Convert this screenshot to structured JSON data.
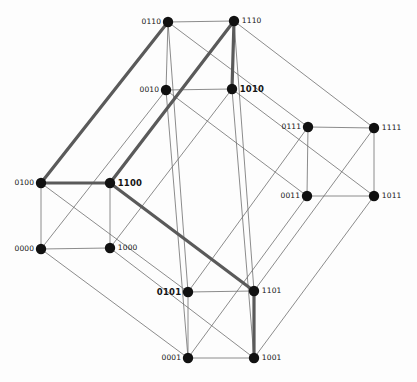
{
  "figure": {
    "kind": "hypercube-graph",
    "title": "",
    "width": 417,
    "height": 382,
    "background": "#fdfdfd",
    "colors": {
      "node_fill": "#111111",
      "edge_normal": "#6e6e6e",
      "edge_highlight": "#5a5a5a",
      "label": "#141414"
    },
    "node_radius": 5.2,
    "edge_width_normal": 0.8,
    "edge_width_highlight": 3.2
  },
  "nodes": [
    {
      "id": "0110",
      "label": "0110",
      "x": 168,
      "y": 22,
      "label_side": "left",
      "bold": false
    },
    {
      "id": "1110",
      "label": "1110",
      "x": 234,
      "y": 21,
      "label_side": "right",
      "bold": false
    },
    {
      "id": "0010",
      "label": "0010",
      "x": 166,
      "y": 90,
      "label_side": "left",
      "bold": false
    },
    {
      "id": "1010",
      "label": "1010",
      "x": 232,
      "y": 89,
      "label_side": "right",
      "bold": true
    },
    {
      "id": "0111",
      "label": "0111",
      "x": 308,
      "y": 127,
      "label_side": "left",
      "bold": false
    },
    {
      "id": "1111",
      "label": "1111",
      "x": 374,
      "y": 128,
      "label_side": "right",
      "bold": false
    },
    {
      "id": "0011",
      "label": "0011",
      "x": 307,
      "y": 196,
      "label_side": "left",
      "bold": false
    },
    {
      "id": "1011",
      "label": "1011",
      "x": 374,
      "y": 196,
      "label_side": "right",
      "bold": false
    },
    {
      "id": "0100",
      "label": "0100",
      "x": 41,
      "y": 183,
      "label_side": "left",
      "bold": false
    },
    {
      "id": "1100",
      "label": "1100",
      "x": 110,
      "y": 183,
      "label_side": "right",
      "bold": true
    },
    {
      "id": "0000",
      "label": "0000",
      "x": 41,
      "y": 249,
      "label_side": "left",
      "bold": false
    },
    {
      "id": "1000",
      "label": "1000",
      "x": 110,
      "y": 248,
      "label_side": "right",
      "bold": false
    },
    {
      "id": "0101",
      "label": "0101",
      "x": 188,
      "y": 292,
      "label_side": "left",
      "bold": true
    },
    {
      "id": "1101",
      "label": "1101",
      "x": 254,
      "y": 291,
      "label_side": "right",
      "bold": false
    },
    {
      "id": "0001",
      "label": "0001",
      "x": 188,
      "y": 358,
      "label_side": "left",
      "bold": false
    },
    {
      "id": "1001",
      "label": "1001",
      "x": 254,
      "y": 358,
      "label_side": "right",
      "bold": false
    }
  ],
  "edges": [
    {
      "from": "0110",
      "to": "1110",
      "highlight": false
    },
    {
      "from": "0110",
      "to": "0010",
      "highlight": false
    },
    {
      "from": "0110",
      "to": "0111",
      "highlight": false
    },
    {
      "from": "0110",
      "to": "0101",
      "highlight": false
    },
    {
      "from": "0110",
      "to": "0100",
      "highlight": true
    },
    {
      "from": "1110",
      "to": "1010",
      "highlight": true
    },
    {
      "from": "1110",
      "to": "1111",
      "highlight": false
    },
    {
      "from": "1110",
      "to": "1100",
      "highlight": true
    },
    {
      "from": "1110",
      "to": "1101",
      "highlight": false
    },
    {
      "from": "0010",
      "to": "1010",
      "highlight": false
    },
    {
      "from": "0010",
      "to": "0011",
      "highlight": false
    },
    {
      "from": "0010",
      "to": "0000",
      "highlight": false
    },
    {
      "from": "0010",
      "to": "0001",
      "highlight": false
    },
    {
      "from": "1010",
      "to": "1011",
      "highlight": false
    },
    {
      "from": "1010",
      "to": "1000",
      "highlight": false
    },
    {
      "from": "1010",
      "to": "1001",
      "highlight": false
    },
    {
      "from": "0111",
      "to": "1111",
      "highlight": false
    },
    {
      "from": "0111",
      "to": "0011",
      "highlight": false
    },
    {
      "from": "0111",
      "to": "0101",
      "highlight": false
    },
    {
      "from": "1111",
      "to": "1011",
      "highlight": false
    },
    {
      "from": "1111",
      "to": "1101",
      "highlight": false
    },
    {
      "from": "0011",
      "to": "1011",
      "highlight": false
    },
    {
      "from": "0011",
      "to": "0001",
      "highlight": false
    },
    {
      "from": "1011",
      "to": "1001",
      "highlight": false
    },
    {
      "from": "0100",
      "to": "1100",
      "highlight": true
    },
    {
      "from": "0100",
      "to": "0000",
      "highlight": false
    },
    {
      "from": "0100",
      "to": "0101",
      "highlight": false
    },
    {
      "from": "1100",
      "to": "1000",
      "highlight": false
    },
    {
      "from": "1100",
      "to": "1101",
      "highlight": true
    },
    {
      "from": "0000",
      "to": "1000",
      "highlight": false
    },
    {
      "from": "0000",
      "to": "0001",
      "highlight": false
    },
    {
      "from": "1000",
      "to": "1001",
      "highlight": false
    },
    {
      "from": "0101",
      "to": "1101",
      "highlight": false
    },
    {
      "from": "0101",
      "to": "0001",
      "highlight": false
    },
    {
      "from": "1101",
      "to": "1001",
      "highlight": true
    },
    {
      "from": "0001",
      "to": "1001",
      "highlight": false
    }
  ],
  "highlighted_path": [
    "0110",
    "0100",
    "1100",
    "1110",
    "1010"
  ],
  "highlighted_path_secondary": [
    "1100",
    "1101",
    "1001"
  ]
}
